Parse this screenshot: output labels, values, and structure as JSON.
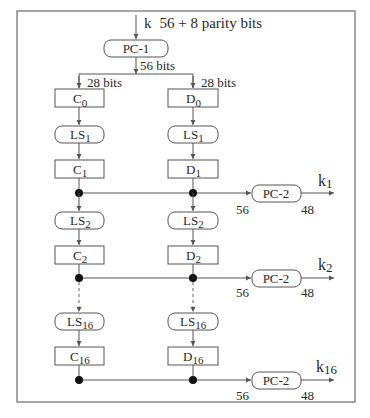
{
  "title_cut": "",
  "input": {
    "key_label": "k",
    "key_desc": "56 + 8 parity bits"
  },
  "pc1": {
    "label": "PC-1",
    "out_bits": "56 bits"
  },
  "split": {
    "left_bits": "28 bits",
    "right_bits": "28 bits"
  },
  "c0": {
    "base": "C",
    "sub": "0"
  },
  "d0": {
    "base": "D",
    "sub": "0"
  },
  "rounds": [
    {
      "ls_base": "LS",
      "ls_sub": "1",
      "c_base": "C",
      "c_sub": "1",
      "d_base": "D",
      "d_sub": "1",
      "pc2": "PC-2",
      "in_bits": "56",
      "out_bits": "48",
      "key_base": "k",
      "key_sub": "1"
    },
    {
      "ls_base": "LS",
      "ls_sub": "2",
      "c_base": "C",
      "c_sub": "2",
      "d_base": "D",
      "d_sub": "2",
      "pc2": "PC-2",
      "in_bits": "56",
      "out_bits": "48",
      "key_base": "k",
      "key_sub": "2"
    },
    {
      "ls_base": "LS",
      "ls_sub": "16",
      "c_base": "C",
      "c_sub": "16",
      "d_base": "D",
      "d_sub": "16",
      "pc2": "PC-2",
      "in_bits": "56",
      "out_bits": "48",
      "key_base": "k",
      "key_sub": "16"
    }
  ],
  "colors": {
    "line": "#555555",
    "frame": "#888888",
    "dot": "#111111",
    "text": "#2a2a2a"
  }
}
